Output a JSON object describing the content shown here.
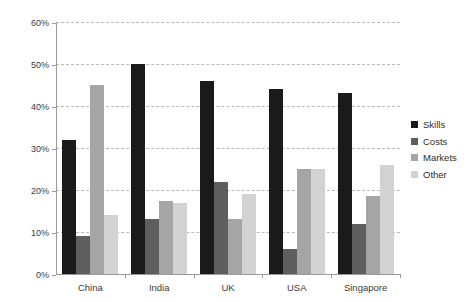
{
  "chart_data": {
    "type": "bar",
    "title": "",
    "subtitle": "",
    "xlabel": "",
    "ylabel": "",
    "categories": [
      "China",
      "India",
      "UK",
      "USA",
      "Singapore"
    ],
    "series": [
      {
        "name": "Skills",
        "color": "#1a1a1a",
        "values": [
          32,
          50,
          46,
          44,
          43
        ]
      },
      {
        "name": "Costs",
        "color": "#5e5e5e",
        "values": [
          9,
          13,
          22,
          6,
          12
        ]
      },
      {
        "name": "Markets",
        "color": "#a5a5a5",
        "values": [
          45,
          17.5,
          13,
          25,
          18.5
        ]
      },
      {
        "name": "Other",
        "color": "#d2d2d2",
        "values": [
          14,
          17,
          19,
          25,
          26
        ]
      }
    ],
    "ylim": [
      0,
      60
    ],
    "ytick_values": [
      0,
      10,
      20,
      30,
      40,
      50,
      60
    ],
    "ytick_labels": [
      "0%",
      "10%",
      "20%",
      "30%",
      "40%",
      "50%",
      "60%"
    ],
    "grid": true,
    "grid_style": "dashed",
    "grid_color": "#b9b9b9",
    "axis_color": "#9a9a9a",
    "legend_position": "right",
    "background": "#ffffff"
  }
}
